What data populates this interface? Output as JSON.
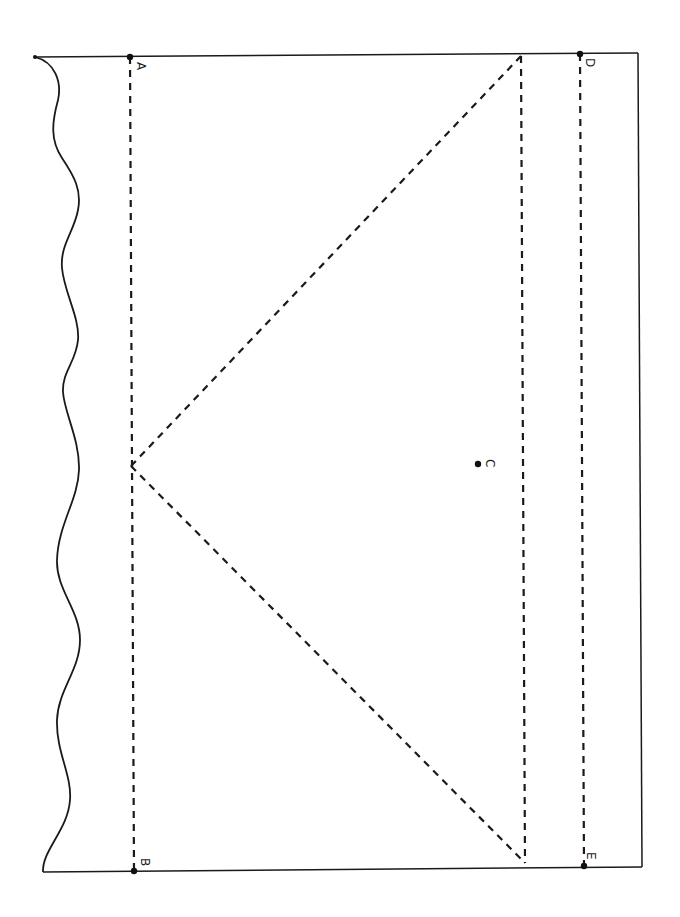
{
  "figure": {
    "orientation": "rotated 90 degrees clockwise (scanned page)",
    "points": {
      "A": {
        "label": "A",
        "x": 130,
        "y": 57
      },
      "B": {
        "label": "B",
        "x": 134,
        "y": 871
      },
      "C": {
        "label": "C",
        "x": 478,
        "y": 464
      },
      "D": {
        "label": "D",
        "x": 580,
        "y": 54
      },
      "E": {
        "label": "E",
        "x": 584,
        "y": 866
      }
    },
    "labels": {
      "A": "A",
      "B": "B",
      "C": "C",
      "D": "D",
      "E": "E"
    },
    "colors": {
      "ink": "#1a1a1a",
      "background": "#ffffff"
    }
  }
}
